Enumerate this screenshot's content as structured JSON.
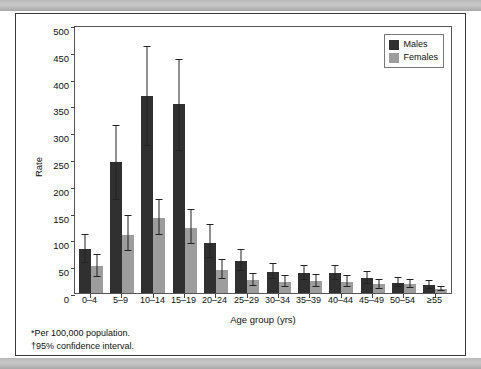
{
  "figure": {
    "yaxis_label": "Rate",
    "xaxis_label": "Age group (yrs)",
    "footnotes": [
      "*Per 100,000 population.",
      "†95% confidence interval."
    ]
  },
  "legend": {
    "position": "top-right",
    "entries": [
      {
        "label": "Males",
        "color": "#303030",
        "key": "males"
      },
      {
        "label": "Females",
        "color": "#9d9d9d",
        "key": "females"
      }
    ]
  },
  "chart_data": {
    "type": "bar",
    "title": "",
    "subtitle": "",
    "xlabel": "Age group (yrs)",
    "ylabel": "Rate",
    "ylim": [
      0,
      500
    ],
    "yticks": [
      0,
      50,
      100,
      150,
      200,
      250,
      300,
      350,
      400,
      450,
      500
    ],
    "ytick_labels": [
      "0",
      "50",
      "100",
      "150",
      "200",
      "250",
      "300",
      "350",
      "400",
      "450",
      "500"
    ],
    "grid": false,
    "legend_position": "upper right",
    "error_bars": "95% confidence interval",
    "categories": [
      "0–4",
      "5–9",
      "10–14",
      "15–19",
      "20–24",
      "25–29",
      "30–34",
      "35–39",
      "40–44",
      "45–49",
      "50–54",
      "≥55"
    ],
    "series": [
      {
        "name": "Males",
        "color": "#303030",
        "values": [
          82,
          245,
          368,
          353,
          94,
          60,
          40,
          37,
          37,
          28,
          19,
          15
        ],
        "ci_low": [
          56,
          174,
          274,
          265,
          65,
          41,
          26,
          24,
          24,
          17,
          11,
          8
        ],
        "ci_high": [
          110,
          313,
          460,
          437,
          128,
          82,
          56,
          53,
          53,
          41,
          29,
          24
        ]
      },
      {
        "name": "Females",
        "color": "#9d9d9d",
        "values": [
          51,
          109,
          140,
          122,
          43,
          24,
          21,
          22,
          21,
          16,
          17,
          7
        ],
        "ci_low": [
          30,
          79,
          108,
          92,
          26,
          13,
          11,
          12,
          11,
          8,
          9,
          3
        ],
        "ci_high": [
          73,
          145,
          176,
          156,
          64,
          38,
          33,
          35,
          33,
          26,
          27,
          14
        ]
      }
    ]
  }
}
